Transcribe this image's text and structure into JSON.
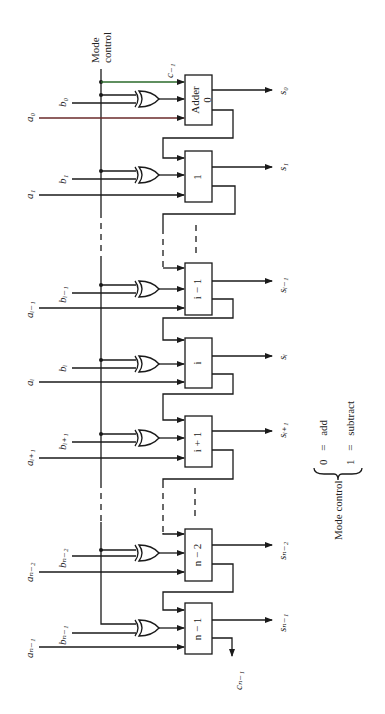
{
  "figure": {
    "orientation": "rotated-90-ccw",
    "mode_control_label_line1": "Mode",
    "mode_control_label_line2": "control",
    "carry_in_label": "c₋₁",
    "carry_out_label": "cₙ₋₁"
  },
  "stages": [
    {
      "id": "0",
      "box_line1": "Adder",
      "box_line2": "0",
      "a_label": "a₀",
      "b_label": "b₀",
      "s_label": "s₀"
    },
    {
      "id": "1",
      "box_line1": "1",
      "box_line2": "",
      "a_label": "a₁",
      "b_label": "b₁",
      "s_label": "s₁"
    },
    {
      "id": "i-1",
      "box_line1": "i − 1",
      "box_line2": "",
      "a_label": "aᵢ₋₁",
      "b_label": "bᵢ₋₁",
      "s_label": "sᵢ₋₁"
    },
    {
      "id": "i",
      "box_line1": "i",
      "box_line2": "",
      "a_label": "aᵢ",
      "b_label": "bᵢ",
      "s_label": "sᵢ"
    },
    {
      "id": "i+1",
      "box_line1": "i + 1",
      "box_line2": "",
      "a_label": "aᵢ₊₁",
      "b_label": "bᵢ₊₁",
      "s_label": "sᵢ₊₁"
    },
    {
      "id": "n-2",
      "box_line1": "n − 2",
      "box_line2": "",
      "a_label": "aₙ₋₂",
      "b_label": "bₙ₋₂",
      "s_label": "sₙ₋₂"
    },
    {
      "id": "n-1",
      "box_line1": "n − 1",
      "box_line2": "",
      "a_label": "aₙ₋₁",
      "b_label": "bₙ₋₁",
      "s_label": "sₙ₋₁"
    }
  ],
  "legend": {
    "title": "Mode control",
    "entries": [
      {
        "value": "0",
        "eq": "=",
        "meaning": "add"
      },
      {
        "value": "1",
        "eq": "=",
        "meaning": "subtract"
      }
    ]
  }
}
